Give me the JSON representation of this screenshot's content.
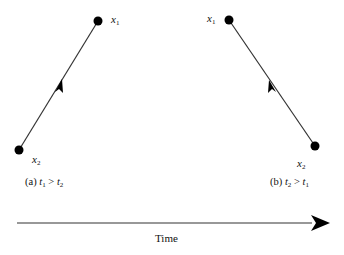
{
  "panel_a": {
    "point_top_label": "x",
    "point_top_sub": "1",
    "point_bottom_label": "x",
    "point_bottom_sub": "2",
    "caption_prefix": "(a) ",
    "caption_t_left": "t",
    "caption_t_left_sub": "1",
    "caption_op": " > ",
    "caption_t_right": "t",
    "caption_t_right_sub": "2",
    "arrow_direction": "from x2 up to x1"
  },
  "panel_b": {
    "point_top_label": "x",
    "point_top_sub": "1",
    "point_bottom_label": "x",
    "point_bottom_sub": "2",
    "caption_prefix": "(b) ",
    "caption_t_left": "t",
    "caption_t_left_sub": "2",
    "caption_op": " > ",
    "caption_t_right": "t",
    "caption_t_right_sub": "1",
    "arrow_direction": "from x2 up to x1"
  },
  "time_axis": {
    "label": "Time",
    "direction": "left-to-right"
  },
  "colors": {
    "line": "#333333",
    "dot": "#000000",
    "background": "#ffffff"
  }
}
